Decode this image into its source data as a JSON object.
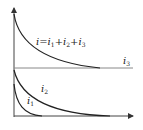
{
  "diagram": {
    "title": "",
    "equation_label": {
      "i": "i",
      "eq": "=",
      "i1": "i",
      "s1": "1",
      "plus1": "+",
      "i2": "i",
      "s2": "2",
      "plus2": "+",
      "i3": "i",
      "s3": "3"
    },
    "labels": {
      "i3": {
        "base": "i",
        "sub": "3"
      },
      "i2": {
        "base": "i",
        "sub": "2"
      },
      "i1": {
        "base": "i",
        "sub": "1"
      }
    },
    "curves": [
      {
        "name": "i",
        "description": "total current, decays to i3 level"
      },
      {
        "name": "i3",
        "description": "constant component (horizontal line)"
      },
      {
        "name": "i2",
        "description": "slower decaying component"
      },
      {
        "name": "i1",
        "description": "fast decaying component"
      }
    ],
    "colors": {
      "line": "#222222",
      "axis": "#444444",
      "baseline": "#888888"
    }
  }
}
